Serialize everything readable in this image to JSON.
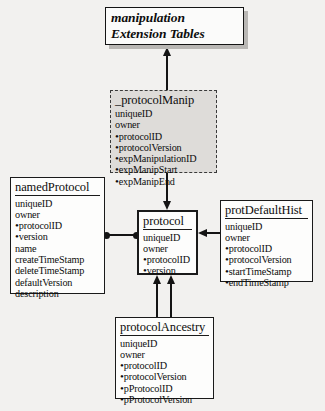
{
  "title_box": {
    "line1": "manipulation",
    "line2": "Extension Tables"
  },
  "entities": {
    "protocolManip": {
      "name": "_protocolManip",
      "fields": [
        {
          "key": false,
          "label": "uniqueID"
        },
        {
          "key": false,
          "label": "owner"
        },
        {
          "key": true,
          "label": "protocolID"
        },
        {
          "key": true,
          "label": "protocolVersion"
        },
        {
          "key": true,
          "label": "expManipulationID"
        },
        {
          "key": true,
          "label": "expManipStart"
        },
        {
          "key": true,
          "label": "expManipEnd"
        }
      ]
    },
    "namedProtocol": {
      "name": "namedProtocol",
      "fields": [
        {
          "key": false,
          "label": "uniqueID"
        },
        {
          "key": false,
          "label": "owner"
        },
        {
          "key": true,
          "label": "protocolID"
        },
        {
          "key": true,
          "label": "version"
        },
        {
          "key": false,
          "label": "name"
        },
        {
          "key": false,
          "label": "createTimeStamp"
        },
        {
          "key": false,
          "label": "deleteTimeStamp"
        },
        {
          "key": false,
          "label": "defaultVersion"
        },
        {
          "key": false,
          "label": "description"
        }
      ]
    },
    "protocol": {
      "name": "protocol",
      "fields": [
        {
          "key": false,
          "label": "uniqueID"
        },
        {
          "key": false,
          "label": "owner"
        },
        {
          "key": true,
          "label": "protocolID"
        },
        {
          "key": true,
          "label": "version"
        }
      ]
    },
    "protDefaultHist": {
      "name": "protDefaultHist",
      "fields": [
        {
          "key": false,
          "label": "uniqueID"
        },
        {
          "key": false,
          "label": "owner"
        },
        {
          "key": true,
          "label": "protocolID"
        },
        {
          "key": true,
          "label": "protocolVersion"
        },
        {
          "key": true,
          "label": "startTimeStamp"
        },
        {
          "key": true,
          "label": "endTimeStamp"
        }
      ]
    },
    "protocolAncestry": {
      "name": "protocolAncestry",
      "fields": [
        {
          "key": false,
          "label": "uniqueID"
        },
        {
          "key": false,
          "label": "owner"
        },
        {
          "key": true,
          "label": "protocolID"
        },
        {
          "key": true,
          "label": "protocolVersion"
        },
        {
          "key": true,
          "label": "pProtocolID"
        },
        {
          "key": true,
          "label": "pProtocolVersion"
        }
      ]
    }
  },
  "bullet_glyph": "•",
  "colors": {
    "page_background": "#f2f1ef",
    "box_fill": "#fdfdfc",
    "shaded_box_fill": "#dedcd9",
    "stroke": "#141414",
    "shadow": "#b9b7b4"
  }
}
